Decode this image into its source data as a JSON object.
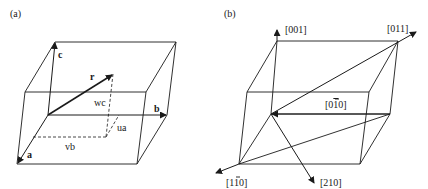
{
  "panel_a": {
    "label": "(a)",
    "vectors": {
      "a": "a",
      "b": "b",
      "c": "c",
      "r": "r"
    },
    "components": {
      "ua": "ua",
      "vb": "vb",
      "wc": "wc"
    }
  },
  "panel_b": {
    "label": "(b)",
    "directions": {
      "d001": "[001]",
      "d011": "[011]",
      "d0m10_prefix": "[0",
      "d0m10_bar": "1",
      "d0m10_suffix": "0]",
      "d1m10_prefix": "[1",
      "d1m10_bar": "1",
      "d1m10_suffix": "0]",
      "d210": "[210]"
    }
  },
  "colors": {
    "line": "#1a1a1a",
    "background": "#ffffff"
  }
}
